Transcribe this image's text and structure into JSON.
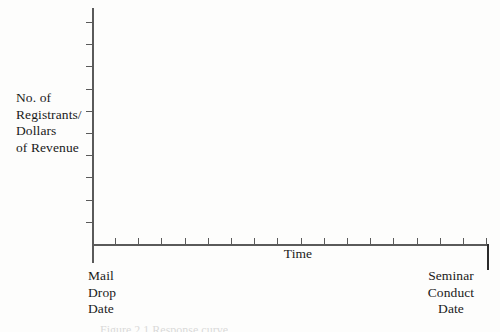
{
  "figure": {
    "background_color": "#fdfdfc",
    "axis_color": "#5a5a5a",
    "text_color": "#1a1a1a",
    "caption_partial": "Figure 2.1  Response curve"
  },
  "chart_data": {
    "type": "line",
    "title": "",
    "subtitle": "",
    "ylabel": "No. of\nRegistrants/\nDollars\nof Revenue",
    "xlabel": "Time",
    "x_start_label": "Mail\nDrop\nDate",
    "x_end_label": "Seminar\nConduct\nDate",
    "series": [
      {
        "name": "",
        "x": [],
        "values": []
      }
    ],
    "categories": [],
    "x_tick_count": 17,
    "y_tick_count": 10,
    "xlim": [
      0,
      17
    ],
    "ylim": [
      0,
      10
    ],
    "grid": false,
    "legend": false,
    "legend_position": "none",
    "annotations": [],
    "note": "Empty axes template: no plotted data points are drawn in the figure."
  }
}
